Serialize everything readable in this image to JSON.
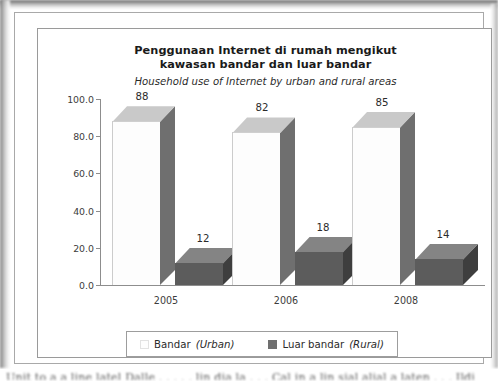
{
  "figure": {
    "title_line_1": "Penggunaan Internet di rumah mengikut",
    "title_line_2": "kawasan bandar dan luar bandar",
    "subtitle": "Household use of Internet by urban and rural areas",
    "bottom_scan_text": "Unit to a a line latel Dalle . . . . . lin dia la . . . Cal in a lin sial alial a laten . . . Ildi"
  },
  "legend": {
    "entries": [
      {
        "name_main": "Bandar ",
        "name_italic": "(Urban)",
        "color": "#fdfdfd"
      },
      {
        "name_main": "Luar bandar ",
        "name_italic": "(Rural)",
        "color": "#6f6f6f"
      }
    ]
  },
  "axis": {
    "y_ticks": [
      "100.0",
      "80.0",
      "60.0",
      "40.0",
      "20.0",
      "0.0"
    ],
    "x_ticks": [
      "2005",
      "2006",
      "2008"
    ]
  },
  "chart_data": {
    "type": "bar",
    "title": "Penggunaan Internet di rumah mengikut kawasan bandar dan luar bandar",
    "subtitle": "Household use of Internet by urban and rural areas",
    "xlabel": "",
    "ylabel": "",
    "ylim": [
      0,
      100
    ],
    "ytick_values": [
      0,
      20,
      40,
      60,
      80,
      100
    ],
    "ytick_labels": [
      "0.0",
      "20.0",
      "40.0",
      "60.0",
      "80.0",
      "100.0"
    ],
    "grid": false,
    "legend_position": "bottom",
    "style": "3d-column",
    "categories": [
      "2005",
      "2006",
      "2008"
    ],
    "series": [
      {
        "name": "Bandar (Urban)",
        "values": [
          88,
          82,
          85
        ],
        "front_color": "#fdfdfd",
        "top_color": "#c9c9c9",
        "side_color": "#6f6f6f"
      },
      {
        "name": "Luar bandar (Rural)",
        "values": [
          12,
          18,
          14
        ],
        "front_color": "#5c5c5c",
        "top_color": "#848484",
        "side_color": "#3e3e3e"
      }
    ],
    "data_labels": {
      "urban": [
        "88",
        "82",
        "85"
      ],
      "rural": [
        "12",
        "18",
        "14"
      ]
    }
  }
}
